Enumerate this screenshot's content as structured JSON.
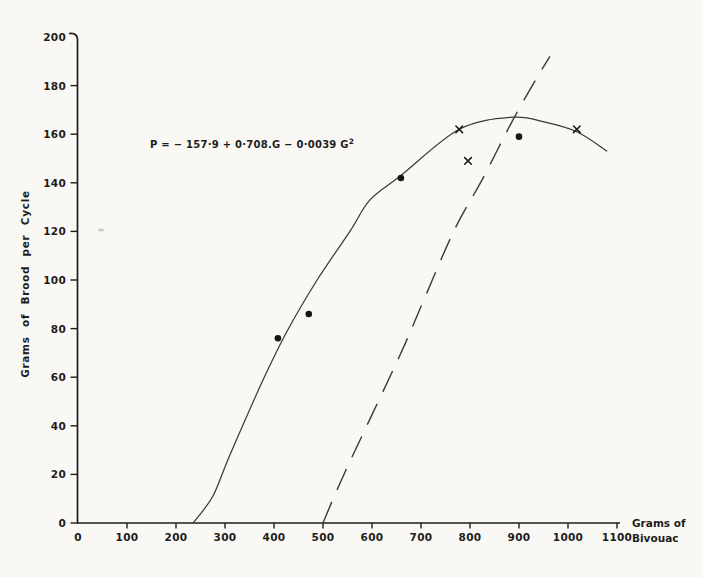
{
  "chart_data": {
    "type": "scatter",
    "title": "",
    "equation": "P = − 157·9 + 0·708.G − 0·0039 G²",
    "equation_main": "P = − 157·9 + 0·708.G − 0·0039 G",
    "equation_sup": "2",
    "xlabel": "Grams of Bivouac",
    "xlabel_lines": [
      "Grams of",
      "Bivouac"
    ],
    "ylabel": "Grams of Brood per Cycle",
    "xlim": [
      0,
      1100
    ],
    "ylim": [
      0,
      200
    ],
    "x_ticks": [
      0,
      100,
      200,
      300,
      400,
      500,
      600,
      700,
      800,
      900,
      1000,
      1100
    ],
    "y_ticks": [
      0,
      20,
      40,
      60,
      80,
      100,
      120,
      140,
      160,
      180,
      200
    ],
    "grid": false,
    "legend": "none",
    "series": [
      {
        "name": "observations-filled-dots",
        "marker": "circle",
        "points": [
          [
            408,
            76
          ],
          [
            471,
            86
          ],
          [
            659,
            142
          ],
          [
            900,
            159
          ]
        ]
      },
      {
        "name": "observations-crosses",
        "marker": "x",
        "points": [
          [
            778,
            162
          ],
          [
            796,
            149
          ],
          [
            1018,
            162
          ]
        ]
      }
    ],
    "curves": [
      {
        "name": "fitted-parabola",
        "style": "solid",
        "points": [
          [
            235,
            0
          ],
          [
            275,
            11
          ],
          [
            310,
            28
          ],
          [
            378,
            59
          ],
          [
            427,
            79
          ],
          [
            488,
            100
          ],
          [
            555,
            120
          ],
          [
            596,
            133
          ],
          [
            659,
            143
          ],
          [
            778,
            162
          ],
          [
            886,
            167
          ],
          [
            953,
            165
          ],
          [
            1018,
            161
          ],
          [
            1080,
            153
          ]
        ]
      },
      {
        "name": "dashed-line",
        "style": "dashed",
        "points": [
          [
            500,
            0
          ],
          [
            545,
            21
          ],
          [
            657,
            69
          ],
          [
            704,
            91
          ],
          [
            769,
            121
          ],
          [
            824,
            141
          ],
          [
            888,
            166
          ],
          [
            933,
            182
          ],
          [
            963,
            192
          ]
        ]
      }
    ],
    "ink_color": "#1d1d1d",
    "background_color": "#f9f8f4"
  }
}
